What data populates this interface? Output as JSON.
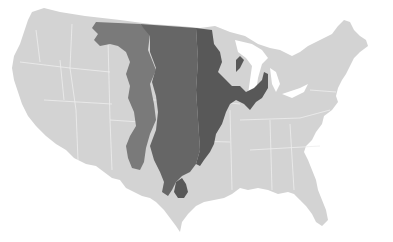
{
  "map": {
    "subject": "Contiguous United States",
    "background_color": "#ffffff",
    "land_color": "#d3d3d3",
    "border_color": "#eeeeee",
    "zones": [
      {
        "id": "western-zone",
        "color": "#7a7a7a"
      },
      {
        "id": "central-zone",
        "color": "#666666"
      },
      {
        "id": "eastern-zone",
        "color": "#585858"
      }
    ]
  }
}
